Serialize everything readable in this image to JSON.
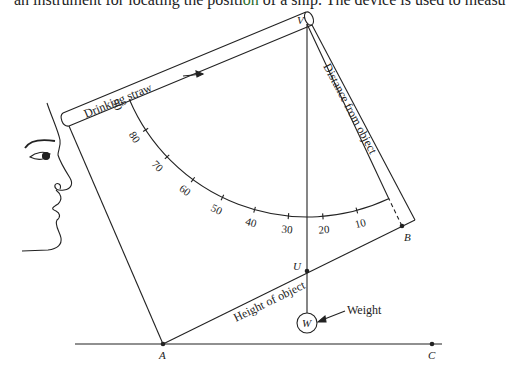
{
  "caption": {
    "before": "an instrument for locating the positi",
    "highlight": "on",
    "after": " of a ship. The device is used to measu"
  },
  "labels": {
    "straw": "Drinking straw",
    "distance": "Distance from object",
    "height": "Height of object",
    "weight": "Weight",
    "weight_symbol": "W",
    "V": "V",
    "U": "U",
    "A": "A",
    "B": "B",
    "C": "C"
  },
  "scale": {
    "center": [
      307,
      24
    ],
    "radius": 193,
    "zero_angle_deg": 64.8,
    "deg_per_unit": 1.024,
    "ticks": [
      10,
      20,
      30,
      40,
      50,
      60,
      70,
      80,
      90
    ]
  },
  "colors": {
    "line": "#222222",
    "highlight": "#2a6b2a"
  }
}
